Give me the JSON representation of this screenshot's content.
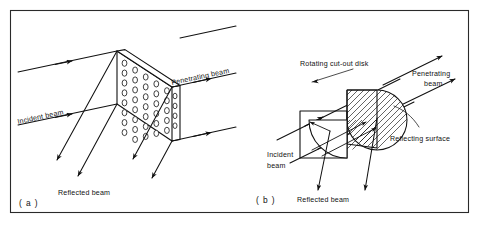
{
  "figure": {
    "background_color": "#ffffff",
    "ink_color": "#111111",
    "frame_color": "#2a2a2a",
    "width": 481,
    "height": 232
  },
  "panels": [
    {
      "id": "panel-a",
      "caption": "( a )",
      "subject": "Perforated plate beam splitter",
      "labels": {
        "incident_beam": "Incident beam",
        "penetrating_beam": "Penetrating beam",
        "reflected_beam": "Reflected beam"
      },
      "slab": {
        "shape": "perforated-parallelogram-slab",
        "hole_rows": 8,
        "hole_cols": 5,
        "hole_shape": "ellipse"
      },
      "beams": {
        "incident_count": 2,
        "penetrating_count": 2,
        "reflected_count": 4
      }
    },
    {
      "id": "panel-b",
      "caption": "( b )",
      "subject": "Rotating cut-out disk beam splitter",
      "labels": {
        "rotating_disk": "Rotating cut-out disk",
        "penetrating_beam_line1": "Penetrating",
        "penetrating_beam_line2": "beam",
        "reflecting_surface": "Reflecting surface",
        "incident_beam_line1": "Incident",
        "incident_beam_line2": "beam",
        "reflected_beam": "Reflected beam"
      },
      "disk": {
        "shape": "circle-with-square-cutout",
        "fill_pattern": "diagonal-hatch"
      },
      "beams": {
        "incident_count": 2,
        "penetrating_count": 2,
        "reflected_count": 2
      }
    }
  ]
}
